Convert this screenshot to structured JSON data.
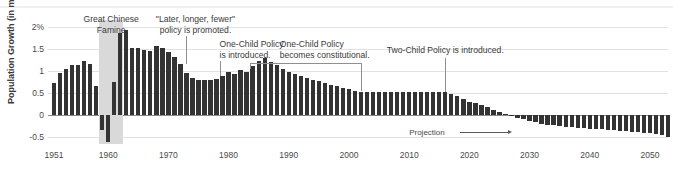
{
  "chart_data": {
    "type": "bar",
    "title": "",
    "subtitle": "",
    "xlabel": "",
    "ylabel": "Population Growth (in millions)",
    "ylim": [
      -0.75,
      2.15
    ],
    "xlim": [
      1950,
      2053
    ],
    "grid": true,
    "legend_position": "none",
    "ytick_labels": [
      "2%",
      "1.5",
      "1",
      "0.5",
      "0",
      "-0.5"
    ],
    "ytick_values": [
      2,
      1.5,
      1,
      0.5,
      0,
      -0.5
    ],
    "xtick_labels": [
      "1951",
      "1960",
      "1970",
      "1980",
      "1990",
      "2000",
      "2010",
      "2020",
      "2030",
      "2040",
      "2050"
    ],
    "xtick_values": [
      1951,
      1960,
      1970,
      1980,
      1990,
      2000,
      2010,
      2020,
      2030,
      2040,
      2050
    ],
    "bar_color": "#333333",
    "grid_color": "#e2e2e2",
    "zero_line_color": "#8a8a8a",
    "band_color": "#d9d9d9",
    "x": [
      1951,
      1952,
      1953,
      1954,
      1955,
      1956,
      1957,
      1958,
      1959,
      1960,
      1961,
      1962,
      1963,
      1964,
      1965,
      1966,
      1967,
      1968,
      1969,
      1970,
      1971,
      1972,
      1973,
      1974,
      1975,
      1976,
      1977,
      1978,
      1979,
      1980,
      1981,
      1982,
      1983,
      1984,
      1985,
      1986,
      1987,
      1988,
      1989,
      1990,
      1991,
      1992,
      1993,
      1994,
      1995,
      1996,
      1997,
      1998,
      1999,
      2000,
      2001,
      2002,
      2003,
      2004,
      2005,
      2006,
      2007,
      2008,
      2009,
      2010,
      2011,
      2012,
      2013,
      2014,
      2015,
      2016,
      2017,
      2018,
      2019,
      2020,
      2021,
      2022,
      2023,
      2024,
      2025,
      2026,
      2027,
      2028,
      2029,
      2030,
      2031,
      2032,
      2033,
      2034,
      2035,
      2036,
      2037,
      2038,
      2039,
      2040,
      2041,
      2042,
      2043,
      2044,
      2045,
      2046,
      2047,
      2048,
      2049,
      2050,
      2051,
      2052,
      2053
    ],
    "values": [
      0.72,
      0.95,
      1.05,
      1.12,
      1.12,
      1.22,
      1.15,
      0.65,
      -0.35,
      -0.62,
      0.75,
      1.85,
      1.93,
      1.52,
      1.52,
      1.46,
      1.44,
      1.56,
      1.52,
      1.43,
      1.32,
      1.16,
      0.95,
      0.83,
      0.8,
      0.8,
      0.8,
      0.82,
      0.87,
      0.97,
      0.92,
      1.02,
      0.98,
      1.1,
      1.23,
      1.28,
      1.2,
      1.12,
      1.05,
      0.98,
      0.92,
      0.88,
      0.83,
      0.8,
      0.76,
      0.72,
      0.68,
      0.65,
      0.62,
      0.58,
      0.55,
      0.53,
      0.52,
      0.52,
      0.52,
      0.52,
      0.52,
      0.52,
      0.52,
      0.52,
      0.52,
      0.52,
      0.52,
      0.52,
      0.52,
      0.52,
      0.48,
      0.42,
      0.36,
      0.3,
      0.26,
      0.22,
      0.17,
      0.12,
      0.07,
      0.03,
      -0.02,
      -0.06,
      -0.1,
      -0.14,
      -0.17,
      -0.2,
      -0.22,
      -0.24,
      -0.26,
      -0.27,
      -0.28,
      -0.29,
      -0.3,
      -0.31,
      -0.32,
      -0.33,
      -0.34,
      -0.35,
      -0.36,
      -0.37,
      -0.38,
      -0.39,
      -0.4,
      -0.41,
      -0.43,
      -0.46,
      -0.5
    ],
    "shaded_band": {
      "label": "Great Chinese Famine",
      "x_start": 1958.5,
      "x_end": 1962.5
    },
    "annotations": [
      {
        "id": "great-chinese-famine",
        "text": "Great Chinese\nFamine",
        "x": 1960.5,
        "align": "center",
        "leader": "none"
      },
      {
        "id": "later-longer-fewer",
        "text": "\"Later, longer, fewer\"\npolicy is promoted.",
        "x": 1973,
        "align": "center",
        "leader": "vertical"
      },
      {
        "id": "one-child-policy-introduced",
        "text": "One-Child Policy\nis introduced.",
        "x": 1979,
        "align": "left",
        "leader": "vertical"
      },
      {
        "id": "one-child-policy-constitutional",
        "text": "One-Child Policy\nbecomes constitutional.",
        "x": 2002,
        "align": "left",
        "leader": "bracket"
      },
      {
        "id": "two-child-policy-introduced",
        "text": "Two-Child Policy is introduced.",
        "x": 2016,
        "align": "center",
        "leader": "vertical"
      }
    ],
    "projection": {
      "label": "Projection",
      "start_year": 2022
    }
  }
}
